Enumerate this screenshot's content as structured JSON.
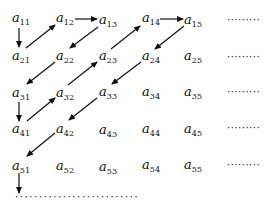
{
  "diagram": {
    "type": "matrix-zigzag-enumeration",
    "symbol": "a",
    "rows": [
      {
        "cells": [
          {
            "label": "a",
            "sub": "11"
          },
          {
            "label": "a",
            "sub": "12"
          },
          {
            "label": "a",
            "sub": "13"
          },
          {
            "label": "a",
            "sub": "14"
          },
          {
            "label": "a",
            "sub": "15"
          }
        ],
        "trailing": "·········"
      },
      {
        "cells": [
          {
            "label": "a",
            "sub": "21"
          },
          {
            "label": "a",
            "sub": "22"
          },
          {
            "label": "a",
            "sub": "23"
          },
          {
            "label": "a",
            "sub": "24"
          },
          {
            "label": "a",
            "sub": "25"
          }
        ],
        "trailing": "·········"
      },
      {
        "cells": [
          {
            "label": "a",
            "sub": "31"
          },
          {
            "label": "a",
            "sub": "32"
          },
          {
            "label": "a",
            "sub": "33"
          },
          {
            "label": "a",
            "sub": "34"
          },
          {
            "label": "a",
            "sub": "35"
          }
        ],
        "trailing": "·········"
      },
      {
        "cells": [
          {
            "label": "a",
            "sub": "41"
          },
          {
            "label": "a",
            "sub": "42"
          },
          {
            "label": "a",
            "sub": "43"
          },
          {
            "label": "a",
            "sub": "44"
          },
          {
            "label": "a",
            "sub": "45"
          }
        ],
        "trailing": "·········"
      },
      {
        "cells": [
          {
            "label": "a",
            "sub": "51"
          },
          {
            "label": "a",
            "sub": "52"
          },
          {
            "label": "a",
            "sub": "53"
          },
          {
            "label": "a",
            "sub": "54"
          },
          {
            "label": "a",
            "sub": "55"
          }
        ],
        "trailing": "·········"
      }
    ],
    "bottom_dots": "··························",
    "arrows": [
      {
        "from": "a11",
        "to": "a21",
        "direction": "down"
      },
      {
        "from": "a21",
        "to": "a12",
        "direction": "up-right"
      },
      {
        "from": "a12",
        "to": "a13",
        "direction": "right"
      },
      {
        "from": "a13",
        "to": "a22",
        "direction": "down-left"
      },
      {
        "from": "a22",
        "to": "a31",
        "direction": "down-left"
      },
      {
        "from": "a31",
        "to": "a41",
        "direction": "down"
      },
      {
        "from": "a41",
        "to": "a32",
        "direction": "up-right"
      },
      {
        "from": "a32",
        "to": "a23",
        "direction": "up-right"
      },
      {
        "from": "a23",
        "to": "a14",
        "direction": "up-right"
      },
      {
        "from": "a14",
        "to": "a15",
        "direction": "right"
      },
      {
        "from": "a15",
        "to": "a24",
        "direction": "down-left"
      },
      {
        "from": "a24",
        "to": "a33",
        "direction": "down-left"
      },
      {
        "from": "a33",
        "to": "a42",
        "direction": "down-left"
      },
      {
        "from": "a42",
        "to": "a51",
        "direction": "down-left"
      },
      {
        "from": "a51",
        "to": "continuation",
        "direction": "down"
      }
    ]
  }
}
